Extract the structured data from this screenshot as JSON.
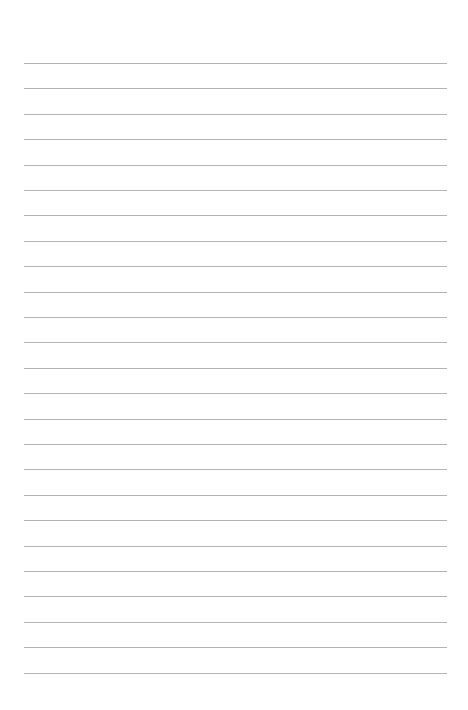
{
  "page": {
    "type": "lined-paper",
    "background_color": "#ffffff",
    "line_color": "#b4b4b4",
    "line_count": 25,
    "first_line_y": 63,
    "line_spacing": 25.4,
    "line_left": 24,
    "line_right": 447
  }
}
